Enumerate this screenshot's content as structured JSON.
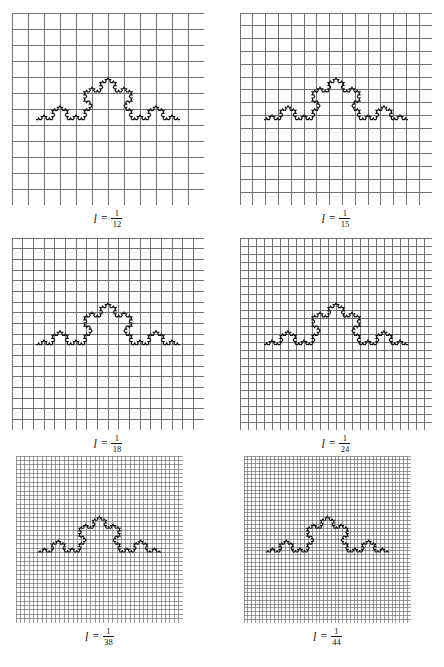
{
  "figure": {
    "background_color": "#ffffff",
    "grid_line_color": "#5b5b5b",
    "curve_color": "#101010",
    "panels": [
      {
        "id": "panel-1",
        "caption_variable": "l",
        "caption_equals": "=",
        "caption_numerator": "1",
        "caption_denominator": "12",
        "grid_cells": 12,
        "box_px": 192,
        "left": 12,
        "top": 13,
        "curve_iterations": 4,
        "curve_baseline_fraction": 0.555,
        "curve_left_fraction": 0.125,
        "curve_right_fraction": 0.875
      },
      {
        "id": "panel-2",
        "caption_variable": "l",
        "caption_equals": "=",
        "caption_numerator": "1",
        "caption_denominator": "15",
        "grid_cells": 15,
        "box_px": 192,
        "left": 240,
        "top": 13,
        "curve_iterations": 4,
        "curve_baseline_fraction": 0.555,
        "curve_left_fraction": 0.125,
        "curve_right_fraction": 0.875
      },
      {
        "id": "panel-3",
        "caption_variable": "l",
        "caption_equals": "=",
        "caption_numerator": "1",
        "caption_denominator": "18",
        "grid_cells": 18,
        "box_px": 192,
        "left": 12,
        "top": 238,
        "curve_iterations": 4,
        "curve_baseline_fraction": 0.555,
        "curve_left_fraction": 0.125,
        "curve_right_fraction": 0.875
      },
      {
        "id": "panel-4",
        "caption_variable": "l",
        "caption_equals": "=",
        "caption_numerator": "1",
        "caption_denominator": "24",
        "grid_cells": 24,
        "box_px": 192,
        "left": 240,
        "top": 238,
        "curve_iterations": 4,
        "curve_baseline_fraction": 0.555,
        "curve_left_fraction": 0.125,
        "curve_right_fraction": 0.875
      },
      {
        "id": "panel-5",
        "caption_variable": "l",
        "caption_equals": "=",
        "caption_numerator": "1",
        "caption_denominator": "38",
        "grid_cells": 38,
        "box_px": 167,
        "left": 16,
        "top": 456,
        "curve_iterations": 4,
        "curve_baseline_fraction": 0.575,
        "curve_left_fraction": 0.13,
        "curve_right_fraction": 0.87
      },
      {
        "id": "panel-6",
        "caption_variable": "l",
        "caption_equals": "=",
        "caption_numerator": "1",
        "caption_denominator": "44",
        "grid_cells": 44,
        "box_px": 167,
        "left": 244,
        "top": 456,
        "curve_iterations": 4,
        "curve_baseline_fraction": 0.575,
        "curve_left_fraction": 0.13,
        "curve_right_fraction": 0.87
      }
    ]
  },
  "chart_data": {
    "type": "line",
    "xlabel": "",
    "ylabel": "",
    "grid": true,
    "legend_position": "none",
    "series": [
      {
        "name": "koch-curve-iteration-4",
        "box_sizes": [
          0.0833,
          0.0667,
          0.0556,
          0.0417,
          0.0263,
          0.0227
        ]
      }
    ],
    "categories": [
      "1/12",
      "1/15",
      "1/18",
      "1/24",
      "1/38",
      "1/44"
    ],
    "values": [
      12,
      15,
      18,
      24,
      38,
      44
    ],
    "annotations": [
      "l = 1/12",
      "l = 1/15",
      "l = 1/18",
      "l = 1/24",
      "l = 1/38",
      "l = 1/44"
    ]
  }
}
